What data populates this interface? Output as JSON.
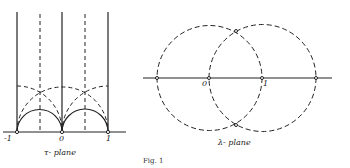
{
  "figure": {
    "caption": "Fig. 1",
    "left_panel": {
      "title": "τ- plane",
      "tick_labels": [
        "-1",
        "0",
        "1"
      ]
    },
    "right_panel": {
      "title": "λ- plane",
      "tick_labels": [
        "0",
        "1"
      ]
    }
  }
}
